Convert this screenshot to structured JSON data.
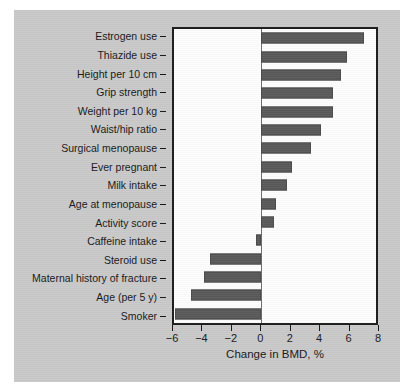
{
  "chart_data": {
    "type": "bar",
    "orientation": "horizontal",
    "title": "",
    "xlabel": "Change in BMD, %",
    "ylabel": "",
    "xlim": [
      -6,
      8
    ],
    "xticks": [
      -6,
      -4,
      -2,
      0,
      2,
      4,
      6,
      8
    ],
    "xtick_labels": [
      "−6",
      "−4",
      "−2",
      "0",
      "2",
      "4",
      "6",
      "8"
    ],
    "grid": false,
    "legend": null,
    "zero_reference_line": 0,
    "categories": [
      "Estrogen use",
      "Thiazide use",
      "Height per 10 cm",
      "Grip strength",
      "Weight per 10 kg",
      "Waist/hip ratio",
      "Surgical menopause",
      "Ever pregnant",
      "Milk intake",
      "Age at menopause",
      "Activity score",
      "Caffeine intake",
      "Steroid use",
      "Maternal history of fracture",
      "Age (per 5 y)",
      "Smoker"
    ],
    "values": [
      7.2,
      6.0,
      5.6,
      5.0,
      5.0,
      4.2,
      3.5,
      2.2,
      1.8,
      1.1,
      0.9,
      -0.3,
      -3.5,
      -3.9,
      -4.8,
      -5.9
    ],
    "bar_color": "#595959",
    "plot_background": "#fdfdfd",
    "figure_background": "#c9c9c9",
    "axis_color": "#1c1c1c"
  }
}
